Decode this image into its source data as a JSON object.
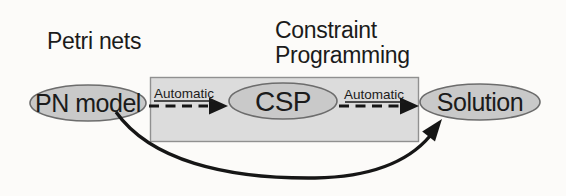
{
  "diagram": {
    "labels": {
      "petri_nets": "Petri nets",
      "constraint_line1": "Constraint",
      "constraint_line2": "Programming"
    },
    "nodes": [
      {
        "id": "pn-model",
        "label": "PN model"
      },
      {
        "id": "csp",
        "label": "CSP"
      },
      {
        "id": "solution",
        "label": "Solution"
      }
    ],
    "edges": [
      {
        "from": "pn-model",
        "to": "csp",
        "label": "Automatic",
        "style": "dashed-arrow"
      },
      {
        "from": "csp",
        "to": "solution",
        "label": "Automatic",
        "style": "dashed-arrow"
      },
      {
        "from": "pn-model",
        "to": "solution",
        "label": "",
        "style": "solid-curved-arrow"
      }
    ],
    "colors": {
      "ellipse_fill": "#c9c9c9",
      "ellipse_stroke": "#6c6c6c",
      "box_fill": "#dcdcdc",
      "box_stroke": "#909090",
      "arrow": "#161616",
      "text": "#1b1b1b",
      "background": "#fcfbf9"
    }
  }
}
